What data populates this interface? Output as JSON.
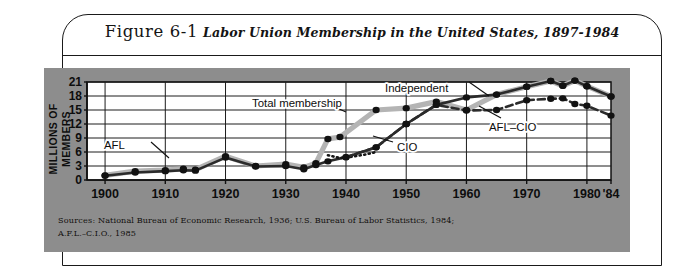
{
  "figure": {
    "number": "Figure 6-1",
    "caption": "Labor Union Membership in the United States, 1897-1984"
  },
  "sources": {
    "label": "Sources:",
    "line1": "National Bureau of Economic Research, 1936; U.S. Bureau of Labor Statistics, 1984;",
    "line2": "A.F.L.–C.I.O., 1985"
  },
  "colors": {
    "plate": "#8d8d8d",
    "page": "#ffffff",
    "ink": "#111111",
    "total_line": "#b4b4b4",
    "afl_line": "#4a4a4a",
    "marker": "#121212"
  },
  "chart_data": {
    "type": "line",
    "title": "Labor Union Membership in the United States, 1897-1984",
    "xlabel": "",
    "ylabel": "MILLIONS OF MEMBERS",
    "ylabel_lines": [
      "MILLIONS OF",
      "MEMBERS"
    ],
    "xlim": [
      1897,
      1984
    ],
    "ylim": [
      0,
      21
    ],
    "yticks": [
      0,
      3,
      6,
      9,
      12,
      15,
      18,
      21
    ],
    "xticks": [
      1900,
      1910,
      1920,
      1930,
      1940,
      1950,
      1960,
      1970,
      1980,
      1984
    ],
    "xticklabels": [
      "1900",
      "1910",
      "1920",
      "1930",
      "1940",
      "1950",
      "1960",
      "1970",
      "1980",
      "'84"
    ],
    "grid": true,
    "legend": "inline-annotations",
    "series": [
      {
        "name": "Total membership",
        "style": "thick-gray",
        "x": [
          1900,
          1905,
          1910,
          1913,
          1915,
          1920,
          1925,
          1930,
          1933,
          1935,
          1937,
          1939,
          1945,
          1950,
          1955,
          1960,
          1965,
          1970,
          1974,
          1976,
          1978,
          1980,
          1984
        ],
        "values": [
          1.0,
          1.9,
          2.1,
          2.4,
          2.2,
          5.1,
          3.0,
          3.4,
          2.7,
          3.6,
          8.8,
          9.2,
          15.0,
          15.4,
          16.8,
          15.0,
          18.3,
          20.0,
          21.2,
          20.2,
          21.3,
          20.1,
          17.9
        ]
      },
      {
        "name": "AFL",
        "style": "dark-solid",
        "x": [
          1900,
          1905,
          1910,
          1913,
          1915,
          1920,
          1925,
          1930,
          1933,
          1935,
          1937,
          1940,
          1945,
          1950
        ],
        "values": [
          0.9,
          1.6,
          1.9,
          2.1,
          2.0,
          4.8,
          2.9,
          3.0,
          2.3,
          3.2,
          4.0,
          4.9,
          7.0,
          12.0
        ]
      },
      {
        "name": "CIO",
        "style": "dotted",
        "x": [
          1937,
          1939,
          1941,
          1943,
          1945
        ],
        "values": [
          5.3,
          4.7,
          5.0,
          5.4,
          6.0
        ]
      },
      {
        "name": "AFL–CIO",
        "style": "dashed",
        "x": [
          1940,
          1945,
          1950,
          1955,
          1960,
          1965,
          1970,
          1974,
          1976,
          1978,
          1980,
          1984
        ],
        "values": [
          4.9,
          7.0,
          12.0,
          16.1,
          14.9,
          15.0,
          17.1,
          17.4,
          17.5,
          16.3,
          15.9,
          13.8
        ]
      },
      {
        "name": "Independent",
        "style": "dark-solid",
        "x": [
          1950,
          1955,
          1960,
          1965,
          1970,
          1974,
          1976,
          1978,
          1980,
          1984
        ],
        "values": [
          12.0,
          16.1,
          17.7,
          18.3,
          20.0,
          21.2,
          20.2,
          21.3,
          20.1,
          17.9
        ]
      }
    ],
    "annotations": [
      {
        "text": "Total membership",
        "x": 252,
        "y": 107
      },
      {
        "text": "Independent",
        "x": 385,
        "y": 92
      },
      {
        "text": "AFL",
        "x": 104,
        "y": 149
      },
      {
        "text": "CIO",
        "x": 397,
        "y": 151
      },
      {
        "text": "AFL–CIO",
        "x": 489,
        "y": 131
      }
    ]
  }
}
